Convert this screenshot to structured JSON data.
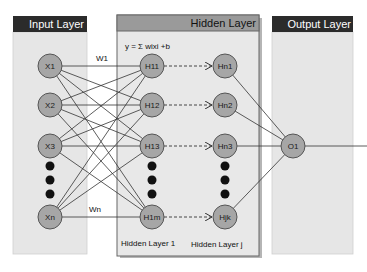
{
  "layers": {
    "input": {
      "title": "Input Layer"
    },
    "hidden": {
      "title": "Hidden Layer",
      "formula": "y = Σ wixi +b",
      "sublayer_1_label": "Hidden Layer 1",
      "sublayer_j_label": "Hidden Layer j"
    },
    "output": {
      "title": "Output Layer"
    }
  },
  "nodes": {
    "input": [
      "X1",
      "X2",
      "X3",
      "Xn"
    ],
    "hidden1": [
      "H11",
      "H12",
      "H13",
      "H1m"
    ],
    "hiddenj": [
      "Hn1",
      "Hn2",
      "Hn3",
      "Hjk"
    ],
    "output": [
      "O1"
    ]
  },
  "weights": {
    "first": "W1",
    "last": "Wn"
  },
  "colors": {
    "header_dark": "#2b2b2b",
    "header_hidden": "#9a9a9a",
    "panel_fill": "#e6e6e6",
    "node_fill": "#a6a6a6",
    "node_stroke": "#555555",
    "edge": "#333333",
    "dot": "#111111"
  }
}
